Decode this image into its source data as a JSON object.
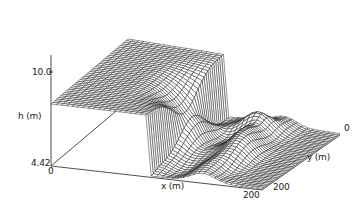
{
  "chart_data": {
    "type": "surface",
    "title": "",
    "xlabel": "x (m)",
    "ylabel": "y (m)",
    "zlabel": "h (m)",
    "xlim": [
      0,
      200
    ],
    "ylim": [
      0,
      200
    ],
    "zlim": [
      4.42,
      10.0
    ],
    "x_ticks": [
      "0",
      "200"
    ],
    "y_ticks": [
      "0",
      "200"
    ],
    "z_ticks": [
      "4.42",
      "10.0"
    ],
    "grid": false,
    "legend": null,
    "regions": [
      {
        "name": "upstream plateau",
        "h_approx": 10.0
      },
      {
        "name": "breach drop",
        "h_range": [
          4.42,
          10.0
        ]
      },
      {
        "name": "downstream floor",
        "h_approx": 4.42
      }
    ]
  },
  "labels": {
    "z_top": "10.0",
    "z_bottom": "4.42",
    "z_axis": "h (m)",
    "x_origin": "0",
    "x_end": "200",
    "x_axis": "x (m)",
    "y_start": "0",
    "y_end": "200",
    "y_axis": "y (m)"
  }
}
